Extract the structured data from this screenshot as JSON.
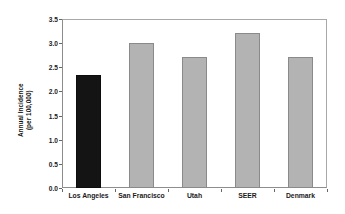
{
  "chart_data": {
    "type": "bar",
    "title": "",
    "subtitle": "",
    "xlabel": "",
    "ylabel": "Annual Incidence (per 100,000)",
    "ylabel_line1": "Annual Incidence",
    "ylabel_line2": "(per 100,000)",
    "categories": [
      "Los Angeles",
      "San Francisco",
      "Utah",
      "SEER",
      "Denmark"
    ],
    "values": [
      2.35,
      3.01,
      2.71,
      3.22,
      2.72
    ],
    "bar_colors": [
      "#141414",
      "#b3b3b3",
      "#b3b3b3",
      "#b3b3b3",
      "#b3b3b3"
    ],
    "bar_styles": [
      "dark",
      "gray",
      "gray",
      "gray",
      "gray"
    ],
    "ylim": [
      0.0,
      3.5
    ],
    "ytick_values": [
      0.0,
      0.5,
      1.0,
      1.5,
      2.0,
      2.5,
      3.0,
      3.5
    ],
    "ytick_labels": [
      "0.0",
      "0.5",
      "1.0",
      "1.5",
      "2.0",
      "2.5",
      "3.0",
      "3.5"
    ],
    "grid": false,
    "legend": null,
    "legend_position": "none",
    "frame": true,
    "annotations": []
  },
  "colors": {
    "background": "#ffffff",
    "highlight_bar": "#141414",
    "standard_bar": "#b3b3b3",
    "bar_edge": "#8a8a8a",
    "axis": "#8d8d8d",
    "text": "#1a1a1a"
  }
}
